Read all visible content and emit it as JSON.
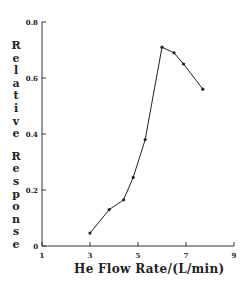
{
  "chart_data": {
    "type": "line",
    "title": "",
    "xlabel": "He Flow Rate/(L/min)",
    "ylabel": "Relative Response",
    "xlim": [
      1,
      9
    ],
    "ylim": [
      0,
      0.8
    ],
    "xticks": [
      1,
      3,
      5,
      7,
      9
    ],
    "yticks": [
      0,
      0.2,
      0.4,
      0.6,
      0.8
    ],
    "xtick_labels": [
      "1",
      "3",
      "5",
      "7",
      "9"
    ],
    "ytick_labels": [
      "0",
      "0.2",
      "0.4",
      "0.6",
      "0.8"
    ],
    "grid": false,
    "legend": null,
    "series": [
      {
        "name": "Relative Response",
        "x": [
          3.0,
          3.8,
          4.4,
          4.8,
          5.3,
          6.0,
          6.5,
          6.9,
          7.7
        ],
        "y": [
          0.046,
          0.13,
          0.165,
          0.245,
          0.38,
          0.71,
          0.69,
          0.65,
          0.56
        ],
        "marker": "dot",
        "color": "#222222"
      }
    ]
  }
}
